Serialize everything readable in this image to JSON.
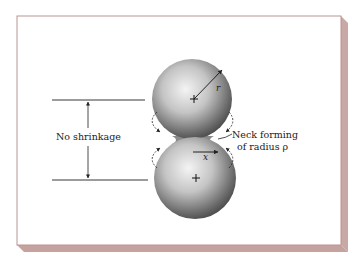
{
  "figure": {
    "labels": {
      "no_shrinkage": "No shrinkage",
      "neck_line1": "Neck forming",
      "neck_line2": "of radius ρ",
      "radius": "r",
      "x": "x"
    },
    "colors": {
      "card_background": "#ffffff",
      "card_border": "#b89590",
      "bevel": "#c9a9a5",
      "sphere_light": "#f2f2f2",
      "sphere_dark": "#555555",
      "line": "#222222"
    },
    "elements": {
      "top_sphere": {
        "cx": 192,
        "cy": 99,
        "r": 40,
        "center_mark": "+"
      },
      "bottom_sphere": {
        "cx": 195,
        "cy": 178,
        "r": 41,
        "center_mark": "+"
      }
    }
  }
}
